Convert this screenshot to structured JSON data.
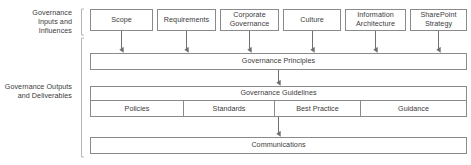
{
  "diagram": {
    "colors": {
      "border": "#8a8a8a",
      "text": "#3b3b3b",
      "bracket": "#b5b5b5",
      "connector": "#6f6f6f",
      "background": "#ffffff"
    },
    "sections": [
      {
        "id": "inputs",
        "label_line1": "Governance",
        "label_line2": "Inputs and",
        "label_line3": "Influences"
      },
      {
        "id": "outputs",
        "label_line1": "Governance Outputs",
        "label_line2": "and Deliverables"
      }
    ],
    "input_nodes": [
      {
        "id": "scope",
        "label": "Scope"
      },
      {
        "id": "requirements",
        "label": "Requirements"
      },
      {
        "id": "corporate",
        "label_line1": "Corporate",
        "label_line2": "Governance"
      },
      {
        "id": "culture",
        "label": "Culture"
      },
      {
        "id": "infoarch",
        "label_line1": "Information",
        "label_line2": "Architecture"
      },
      {
        "id": "spstrategy",
        "label_line1": "SharePoint",
        "label_line2": "Strategy"
      }
    ],
    "bars": {
      "principles": "Governance Principles",
      "guidelines": "Governance Guidelines",
      "communications": "Communications"
    },
    "guideline_cells": [
      {
        "id": "policies",
        "label": "Policies"
      },
      {
        "id": "standards",
        "label": "Standards"
      },
      {
        "id": "bestpractice",
        "label": "Best Practice"
      },
      {
        "id": "guidance",
        "label": "Guidance"
      }
    ]
  }
}
